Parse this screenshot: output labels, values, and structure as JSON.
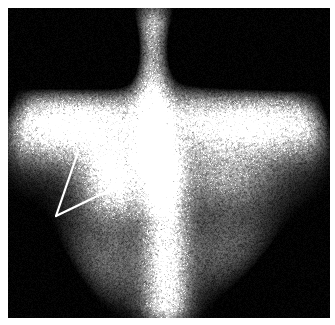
{
  "viewer": {
    "width": 335,
    "height": 325,
    "background_color": "#ffffff",
    "title": "Planar scintigraphy scan"
  },
  "scan": {
    "name": "nuclear-medicine-scintigram",
    "modality_label": "Scintigraphy",
    "plate": {
      "x": 8,
      "y": 8,
      "width": 322,
      "height": 310,
      "background_color": "#000000"
    },
    "field_of_view": {
      "shape": "circle",
      "center_x": 166,
      "center_y": 165,
      "radius_x": 168,
      "radius_y": 166,
      "edge_softness": 26
    },
    "colormap": "grayscale",
    "noise": {
      "type": "poisson-speckle",
      "amplitude": 0.42,
      "grain_px": 1.6
    },
    "background_level": 0.02,
    "features": [
      {
        "name": "upper-spine-band",
        "kind": "vertical-band",
        "x": 152,
        "y_start": 8,
        "y_end": 150,
        "half_width": 16,
        "intensity": 0.96
      },
      {
        "name": "lower-spine-band",
        "kind": "vertical-band",
        "x": 166,
        "y_start": 170,
        "y_end": 322,
        "half_width": 20,
        "intensity": 0.98
      },
      {
        "name": "mid-spine-bridge",
        "kind": "vertical-band",
        "x": 158,
        "y_start": 140,
        "y_end": 185,
        "half_width": 14,
        "intensity": 0.72
      },
      {
        "name": "transverse-uptake-band",
        "kind": "horizontal-band",
        "y": 118,
        "x_start": 14,
        "x_end": 330,
        "half_height": 30,
        "intensity": 0.7
      },
      {
        "name": "left-shoulder-uptake",
        "kind": "blob",
        "x": 72,
        "y": 130,
        "radius_x": 62,
        "radius_y": 34,
        "intensity": 0.78
      },
      {
        "name": "right-shoulder-uptake",
        "kind": "blob",
        "x": 252,
        "y": 128,
        "radius_x": 74,
        "radius_y": 32,
        "intensity": 0.66
      },
      {
        "name": "focal-hot-spot",
        "kind": "blob",
        "x": 114,
        "y": 168,
        "radius_x": 30,
        "radius_y": 26,
        "intensity": 1.0
      },
      {
        "name": "left-paraspinal-uptake",
        "kind": "blob",
        "x": 118,
        "y": 196,
        "radius_x": 34,
        "radius_y": 26,
        "intensity": 0.62
      },
      {
        "name": "right-midfield-uptake",
        "kind": "blob",
        "x": 224,
        "y": 176,
        "radius_x": 48,
        "radius_y": 30,
        "intensity": 0.5
      },
      {
        "name": "lower-left-soft-tissue",
        "kind": "blob",
        "x": 96,
        "y": 262,
        "radius_x": 58,
        "radius_y": 44,
        "intensity": 0.4
      },
      {
        "name": "lower-right-soft-tissue",
        "kind": "blob",
        "x": 236,
        "y": 252,
        "radius_x": 56,
        "radius_y": 44,
        "intensity": 0.34
      },
      {
        "name": "upper-left-dark-corner",
        "kind": "dark-blob",
        "x": 40,
        "y": 34,
        "radius_x": 66,
        "radius_y": 56,
        "intensity": 0.9
      },
      {
        "name": "upper-right-dark-corner",
        "kind": "dark-blob",
        "x": 292,
        "y": 40,
        "radius_x": 72,
        "radius_y": 58,
        "intensity": 0.9
      },
      {
        "name": "upper-mid-left-dark",
        "kind": "dark-blob",
        "x": 106,
        "y": 54,
        "radius_x": 52,
        "radius_y": 42,
        "intensity": 0.55
      },
      {
        "name": "upper-mid-right-dark",
        "kind": "dark-blob",
        "x": 214,
        "y": 50,
        "radius_x": 48,
        "radius_y": 40,
        "intensity": 0.55
      },
      {
        "name": "lower-left-dark-corner",
        "kind": "dark-blob",
        "x": 26,
        "y": 292,
        "radius_x": 60,
        "radius_y": 52,
        "intensity": 0.85
      },
      {
        "name": "lower-right-dark-corner",
        "kind": "dark-blob",
        "x": 308,
        "y": 296,
        "radius_x": 64,
        "radius_y": 54,
        "intensity": 0.85
      }
    ]
  },
  "annotations": {
    "name": "radiologist-arrow-markers",
    "color": "#ffffff",
    "markers": [
      {
        "name": "arrow-marker-upper",
        "tip_x": 78,
        "tip_y": 152,
        "tail_x": 56,
        "tail_y": 216,
        "width": 2.2
      },
      {
        "name": "arrow-marker-lower",
        "tip_x": 112,
        "tip_y": 189,
        "tail_x": 56,
        "tail_y": 216,
        "width": 2.2
      }
    ]
  }
}
